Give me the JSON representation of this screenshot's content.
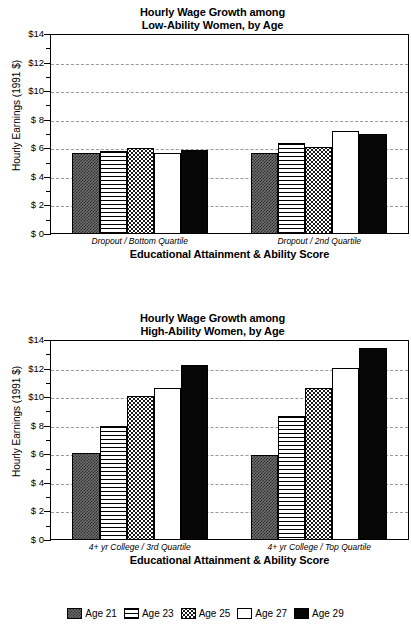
{
  "y_axis": {
    "label": "Hourly Earnings (1991 $)",
    "ticks": [
      "$14",
      "$12",
      "$10",
      "$  8",
      "$  6",
      "$  4",
      "$  2",
      "$  0"
    ]
  },
  "x_axis": {
    "title": "Educational Attainment & Ability  Score"
  },
  "legend": {
    "items": [
      {
        "label": "Age 21",
        "pattern": "checkered",
        "color": "#5a5a5a"
      },
      {
        "label": "Age 23",
        "pattern": "horizontal-lines",
        "color": "#ffffff"
      },
      {
        "label": "Age 25",
        "pattern": "dotted",
        "color": "#ffffff"
      },
      {
        "label": "Age 27",
        "pattern": "solid-white",
        "color": "#ffffff"
      },
      {
        "label": "Age 29",
        "pattern": "solid-black",
        "color": "#000000"
      }
    ]
  },
  "chart_data": [
    {
      "type": "bar",
      "title": "Hourly Wage Growth among Low-Ability Women, by Age",
      "title_line1": "Hourly Wage Growth among",
      "title_line2": "Low-Ability Women, by Age",
      "xlabel": "Educational Attainment & Ability  Score",
      "ylabel": "Hourly Earnings (1991 $)",
      "ylim": [
        0,
        14
      ],
      "ytick_values": [
        0,
        2,
        4,
        6,
        8,
        10,
        12,
        14
      ],
      "ytick_labels": [
        "$  0",
        "$  2",
        "$  4",
        "$  6",
        "$  8",
        "$10",
        "$12",
        "$14"
      ],
      "grid": true,
      "legend_position": "bottom",
      "categories": [
        "Dropout / Bottom Quartile",
        "Dropout / 2nd Quartile"
      ],
      "series": [
        {
          "name": "Age 21",
          "values": [
            5.6,
            5.6
          ]
        },
        {
          "name": "Age 23",
          "values": [
            5.75,
            6.3
          ]
        },
        {
          "name": "Age 25",
          "values": [
            5.95,
            6.05
          ]
        },
        {
          "name": "Age 27",
          "values": [
            5.6,
            7.15
          ]
        },
        {
          "name": "Age 29",
          "values": [
            5.8,
            6.95
          ]
        }
      ]
    },
    {
      "type": "bar",
      "title": "Hourly Wage Growth among High-Ability Women, by Age",
      "title_line1": "Hourly Wage Growth among",
      "title_line2": "High-Ability Women, by Age",
      "xlabel": "Educational Attainment & Ability  Score",
      "ylabel": "Hourly Earnings (1991 $)",
      "ylim": [
        0,
        14
      ],
      "ytick_values": [
        0,
        2,
        4,
        6,
        8,
        10,
        12,
        14
      ],
      "ytick_labels": [
        "$  0",
        "$  2",
        "$  4",
        "$  6",
        "$  8",
        "$10",
        "$12",
        "$14"
      ],
      "grid": true,
      "legend_position": "bottom",
      "categories": [
        "4+ yr College / 3rd Quartile",
        "4+ yr College / Top Quartile"
      ],
      "series": [
        {
          "name": "Age 21",
          "values": [
            6.0,
            5.9
          ]
        },
        {
          "name": "Age 23",
          "values": [
            7.9,
            8.6
          ]
        },
        {
          "name": "Age 25",
          "values": [
            10.0,
            10.6
          ]
        },
        {
          "name": "Age 27",
          "values": [
            10.6,
            12.0
          ]
        },
        {
          "name": "Age 29",
          "values": [
            12.2,
            13.4
          ]
        }
      ]
    }
  ]
}
